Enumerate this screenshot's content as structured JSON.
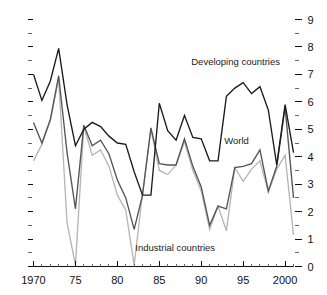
{
  "chart_data": {
    "type": "line",
    "title": "",
    "subtitle": "",
    "xlabel": "",
    "ylabel": "",
    "xlim": [
      1970,
      2001
    ],
    "ylim": [
      0,
      9
    ],
    "grid": false,
    "legend_position": "inline-annotations",
    "x_tick_labels": [
      "1970",
      "75",
      "80",
      "85",
      "90",
      "95",
      "2000"
    ],
    "x_tick_values": [
      1970,
      1975,
      1980,
      1985,
      1990,
      1995,
      2000
    ],
    "x_minor_step": 1,
    "y_axis_side": "right",
    "y_tick_labels": [
      "0",
      "1",
      "2",
      "3",
      "4",
      "5",
      "6",
      "7",
      "8",
      "9"
    ],
    "y_tick_values": [
      0,
      1,
      2,
      3,
      4,
      5,
      6,
      7,
      8,
      9
    ],
    "y_minor_step": 0.5,
    "left_axis_ticks_unlabeled": true,
    "x": [
      1970,
      1971,
      1972,
      1973,
      1974,
      1975,
      1976,
      1977,
      1978,
      1979,
      1980,
      1981,
      1982,
      1983,
      1984,
      1985,
      1986,
      1987,
      1988,
      1989,
      1990,
      1991,
      1992,
      1993,
      1994,
      1995,
      1996,
      1997,
      1998,
      1999,
      2000,
      2001
    ],
    "series": [
      {
        "name": "Developing countries",
        "color": "#1a1a1a",
        "label_x": 1994.1,
        "label_y": 7.35,
        "values": [
          7.0,
          6.05,
          6.75,
          7.95,
          5.9,
          4.4,
          5.0,
          5.25,
          5.1,
          4.75,
          4.5,
          4.45,
          3.45,
          2.6,
          2.6,
          5.95,
          4.95,
          4.6,
          5.5,
          4.7,
          4.65,
          3.85,
          3.85,
          6.2,
          6.5,
          6.7,
          6.3,
          6.55,
          5.7,
          3.7,
          5.9,
          4.15
        ]
      },
      {
        "name": "World",
        "color": "#555555",
        "label_x": 1994.2,
        "label_y": 4.45,
        "values": [
          5.25,
          4.5,
          5.35,
          6.95,
          4.15,
          2.1,
          5.15,
          4.4,
          4.6,
          4.1,
          3.15,
          2.5,
          1.35,
          2.6,
          5.05,
          3.75,
          3.7,
          3.7,
          4.65,
          3.65,
          2.9,
          1.5,
          2.2,
          2.1,
          3.6,
          3.65,
          3.75,
          4.25,
          2.75,
          3.65,
          5.8,
          2.5
        ]
      },
      {
        "name": "Industrial countries",
        "color": "#b4b4b4",
        "label_x": 1986.9,
        "label_y": 0.55,
        "values": [
          3.85,
          4.45,
          5.3,
          6.85,
          1.6,
          0.05,
          5.1,
          4.05,
          4.25,
          3.65,
          2.6,
          2.05,
          0.05,
          2.65,
          5.0,
          3.5,
          3.35,
          3.7,
          4.55,
          3.5,
          2.75,
          1.35,
          2.2,
          1.3,
          3.6,
          3.1,
          3.55,
          3.85,
          2.7,
          3.55,
          4.05,
          1.15
        ]
      }
    ]
  }
}
